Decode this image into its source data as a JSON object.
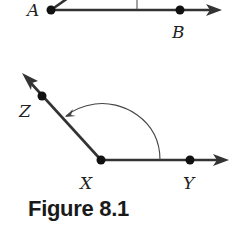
{
  "figure": {
    "caption": "Figure 8.1",
    "angle_top": {
      "vertex": "A",
      "points": [
        "A",
        "B"
      ]
    },
    "angle_bottom": {
      "vertex": "X",
      "points": [
        "Z",
        "X",
        "Y"
      ]
    },
    "labels": {
      "A": "A",
      "B": "B",
      "Z": "Z",
      "X": "X",
      "Y": "Y"
    },
    "colors": {
      "stroke": "#333333",
      "point": "#111111"
    }
  }
}
